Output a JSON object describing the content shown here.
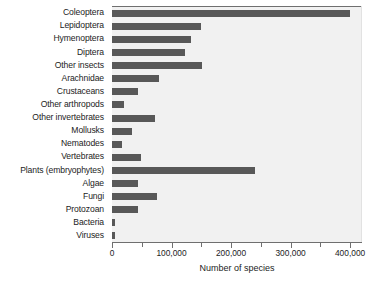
{
  "chart_data": {
    "type": "bar",
    "orientation": "horizontal",
    "title": "",
    "xlabel": "Number of species",
    "ylabel": "",
    "xlim": [
      0,
      420000
    ],
    "grid": false,
    "legend": null,
    "bar_color": "#585858",
    "plot_background": "#f1f1f1",
    "xticks": [
      0,
      100000,
      200000,
      300000,
      400000
    ],
    "xtick_labels": [
      "0",
      "100,000",
      "200,000",
      "300,000",
      "400,000"
    ],
    "xminor_ticks": [
      50000,
      150000,
      250000,
      350000
    ],
    "categories": [
      "Coleoptera",
      "Lepidoptera",
      "Hymenoptera",
      "Diptera",
      "Other insects",
      "Arachnidae",
      "Crustaceans",
      "Other arthropods",
      "Other invertebrates",
      "Mollusks",
      "Nematodes",
      "Vertebrates",
      "Plants (embryophytes)",
      "Algae",
      "Fungi",
      "Protozoan",
      "Bacteria",
      "Viruses"
    ],
    "values": [
      400000,
      150000,
      133000,
      122000,
      152000,
      79000,
      43000,
      20000,
      72000,
      33000,
      16000,
      48000,
      240000,
      43000,
      76000,
      44000,
      5000,
      5000
    ]
  }
}
